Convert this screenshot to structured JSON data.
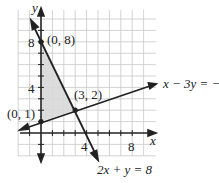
{
  "graph": {
    "x_axis_label": "x",
    "y_axis_label": "y",
    "tick_labels": {
      "x4": "4",
      "x8": "8",
      "y4": "4",
      "y8": "8"
    },
    "points": [
      {
        "label": "(0, 8)",
        "x": 0,
        "y": 8
      },
      {
        "label": "(3, 2)",
        "x": 3,
        "y": 2
      },
      {
        "label": "(0, 1)",
        "x": 0,
        "y": 1
      }
    ],
    "lines": [
      {
        "label": "x − 3y = −3"
      },
      {
        "label": "2x + y = 8"
      }
    ],
    "shading_color": "#d8d8d8",
    "grid_color": "#c8c8c8",
    "line_color": "#222222"
  }
}
